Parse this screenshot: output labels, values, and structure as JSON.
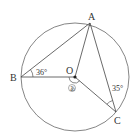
{
  "diagram": {
    "type": "circle-geometry",
    "circle": {
      "cx": 75,
      "cy": 77,
      "r": 54,
      "stroke": "#555555"
    },
    "points": {
      "A": {
        "label": "A",
        "x": 90,
        "y": 23
      },
      "B": {
        "label": "B",
        "x": 21,
        "y": 77
      },
      "C": {
        "label": "C",
        "x": 116,
        "y": 112
      },
      "O": {
        "label": "O",
        "x": 75,
        "y": 77
      }
    },
    "angles": {
      "ABO": {
        "label": "36°"
      },
      "ACO": {
        "label": "35°"
      },
      "unknown": {
        "label": "あ"
      }
    }
  }
}
